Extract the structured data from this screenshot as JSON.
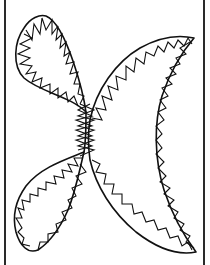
{
  "drawing": {
    "description": "Black-and-white line drawing of a stylized butterfly-like shape: two teardrop wings on the left (upper and lower) meeting at a central stem, and a large crescent on the right, all outlined with zigzag (sawtooth) stitch edges, inside a frame with left and right vertical border lines.",
    "colors": {
      "background": "#ffffff",
      "ink": "#111111",
      "border": "#2a2a2a"
    },
    "shapes": [
      {
        "name": "upper-left-wing",
        "type": "teardrop"
      },
      {
        "name": "lower-left-wing",
        "type": "teardrop"
      },
      {
        "name": "right-crescent",
        "type": "crescent"
      },
      {
        "name": "center-stem",
        "type": "zigzag-column"
      }
    ],
    "frame": {
      "left_border_x": 5,
      "right_border_x": 204
    }
  }
}
